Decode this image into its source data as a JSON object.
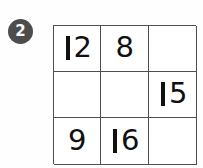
{
  "page": {
    "width": 203,
    "height": 168,
    "background_color": "#fefefe"
  },
  "question": {
    "badge_label": "2",
    "badge_color": "#4d4d4d",
    "badge_text_color": "#fdfdfd",
    "badge_icon": "circled-number-badge"
  },
  "grid": {
    "rows": 3,
    "columns": 3,
    "border_color": "#4f4f52",
    "cell_background": "#ffffff",
    "digit_color": "#111111",
    "cells": [
      [
        {
          "value": "12",
          "empty": false
        },
        {
          "value": "8",
          "empty": false
        },
        {
          "value": "",
          "empty": true
        }
      ],
      [
        {
          "value": "",
          "empty": true
        },
        {
          "value": "",
          "empty": true
        },
        {
          "value": "15",
          "empty": false
        }
      ],
      [
        {
          "value": "9",
          "empty": false
        },
        {
          "value": "16",
          "empty": false
        },
        {
          "value": "",
          "empty": true
        }
      ]
    ]
  }
}
